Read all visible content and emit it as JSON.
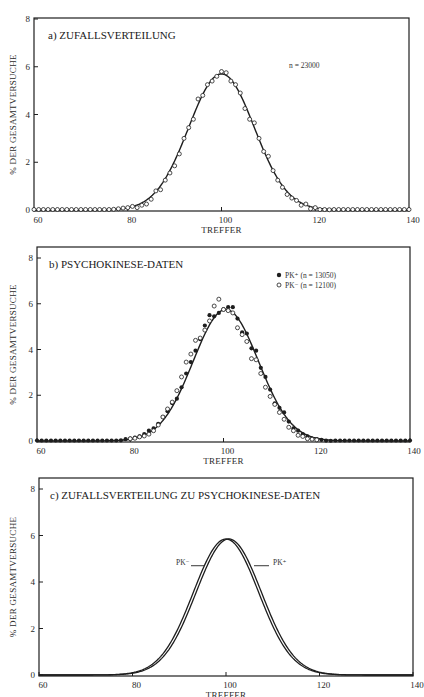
{
  "chart_data": [
    {
      "panel": "a",
      "type": "scatter",
      "title": "a) ZUFALLSVERTEILUNG",
      "xlabel": "TREFFER",
      "ylabel": "% DER GESAMTVERSUCHE",
      "xlim": [
        60,
        140
      ],
      "ylim": [
        0,
        8
      ],
      "xticks": [
        60,
        80,
        100,
        120,
        140
      ],
      "yticks": [
        0,
        2,
        4,
        6,
        8
      ],
      "grid": false,
      "annotation": "n = 23000",
      "fit_curve": {
        "type": "gaussian",
        "mean": 100,
        "peak": 5.7,
        "sd": 7.0
      },
      "series": [
        {
          "name": "Zufall",
          "marker": "open-circle",
          "x": [
            60,
            61,
            62,
            63,
            64,
            65,
            66,
            67,
            68,
            69,
            70,
            71,
            72,
            73,
            74,
            75,
            76,
            77,
            78,
            79,
            80,
            81,
            82,
            83,
            84,
            85,
            86,
            87,
            88,
            89,
            90,
            91,
            92,
            93,
            94,
            95,
            96,
            97,
            98,
            99,
            100,
            101,
            102,
            103,
            104,
            105,
            106,
            107,
            108,
            109,
            110,
            111,
            112,
            113,
            114,
            115,
            116,
            117,
            118,
            119,
            120,
            121,
            122,
            123,
            124,
            125,
            126,
            127,
            128,
            129,
            130,
            131,
            132,
            133,
            134,
            135,
            136,
            137,
            138,
            139,
            140
          ],
          "y": [
            0,
            0,
            0,
            0,
            0,
            0,
            0,
            0,
            0,
            0,
            0,
            0,
            0,
            0,
            0,
            0,
            0.02,
            0.03,
            0.05,
            0.08,
            0.1,
            0.15,
            0.1,
            0.2,
            0.25,
            0.45,
            0.8,
            0.85,
            1.25,
            1.55,
            1.85,
            2.35,
            3.0,
            3.45,
            3.8,
            4.65,
            4.8,
            5.25,
            5.4,
            5.6,
            5.8,
            5.75,
            5.4,
            5.25,
            4.9,
            4.25,
            3.8,
            3.65,
            3.0,
            2.45,
            2.25,
            1.65,
            1.25,
            0.95,
            0.65,
            0.5,
            0.4,
            0.2,
            0.25,
            0.05,
            0.1,
            0.02,
            0.02,
            0.01,
            0,
            0,
            0,
            0,
            0,
            0,
            0,
            0,
            0,
            0,
            0,
            0,
            0,
            0,
            0,
            0,
            0
          ]
        }
      ]
    },
    {
      "panel": "b",
      "type": "scatter",
      "title": "b) PSYCHOKINESE-DATEN",
      "xlabel": "TREFFER",
      "ylabel": "% DER GESAMTVERSUCHE",
      "xlim": [
        60,
        140
      ],
      "ylim": [
        0,
        8
      ],
      "xticks": [
        60,
        80,
        100,
        120,
        140
      ],
      "yticks": [
        0,
        2,
        4,
        6,
        8
      ],
      "grid": false,
      "legend_position": "upper right",
      "fit_curve": {
        "type": "gaussian",
        "mean": 100.5,
        "peak": 5.75,
        "sd": 7.0
      },
      "series": [
        {
          "name": "PK⁺ (n = 13050)",
          "marker": "filled-circle",
          "x": [
            60,
            61,
            62,
            63,
            64,
            65,
            66,
            67,
            68,
            69,
            70,
            71,
            72,
            73,
            74,
            75,
            76,
            77,
            78,
            79,
            80,
            81,
            82,
            83,
            84,
            85,
            86,
            87,
            88,
            89,
            90,
            91,
            92,
            93,
            94,
            95,
            96,
            97,
            98,
            99,
            100,
            101,
            102,
            103,
            104,
            105,
            106,
            107,
            108,
            109,
            110,
            111,
            112,
            113,
            114,
            115,
            116,
            117,
            118,
            119,
            120,
            121,
            122,
            123,
            124,
            125,
            126,
            127,
            128,
            129,
            130,
            131,
            132,
            133,
            134,
            135,
            136,
            137,
            138,
            139,
            140
          ],
          "y": [
            0,
            0,
            0,
            0,
            0,
            0,
            0,
            0,
            0,
            0,
            0,
            0,
            0,
            0,
            0,
            0,
            0,
            0,
            0.03,
            0.08,
            0.1,
            0.15,
            0.2,
            0.3,
            0.45,
            0.55,
            0.75,
            1.05,
            1.3,
            1.65,
            1.85,
            2.35,
            2.95,
            3.45,
            3.95,
            4.45,
            5.05,
            5.5,
            5.45,
            5.6,
            5.75,
            5.85,
            5.85,
            5.35,
            4.75,
            4.7,
            4.05,
            3.95,
            3.2,
            2.8,
            2.25,
            1.65,
            1.45,
            1.25,
            0.85,
            0.55,
            0.45,
            0.3,
            0.2,
            0.1,
            0.08,
            0.05,
            0.02,
            0.01,
            0,
            0,
            0,
            0,
            0,
            0,
            0,
            0,
            0,
            0,
            0,
            0,
            0,
            0,
            0,
            0,
            0
          ]
        },
        {
          "name": "PK⁻ (n = 12100)",
          "marker": "open-circle",
          "x": [
            80,
            81,
            82,
            83,
            84,
            85,
            86,
            87,
            88,
            89,
            90,
            91,
            92,
            93,
            94,
            95,
            96,
            97,
            98,
            99,
            100,
            101,
            102,
            103,
            104,
            105,
            106,
            107,
            108,
            109,
            110,
            111,
            112,
            113,
            114,
            115,
            116,
            117,
            118,
            119,
            120
          ],
          "y": [
            0.1,
            0.12,
            0.18,
            0.22,
            0.3,
            0.45,
            0.7,
            1.05,
            1.4,
            1.7,
            2.2,
            2.8,
            3.45,
            3.8,
            4.4,
            4.5,
            4.85,
            5.25,
            5.9,
            6.2,
            5.75,
            5.7,
            5.6,
            4.95,
            4.65,
            4.35,
            3.6,
            3.55,
            2.95,
            2.35,
            1.95,
            1.6,
            1.25,
            0.95,
            0.6,
            0.45,
            0.25,
            0.2,
            0.1,
            0.08,
            0.05
          ]
        }
      ]
    },
    {
      "panel": "c",
      "type": "line",
      "title": "c) ZUFALLSVERTEILUNG ZU PSYCHOKINESE-DATEN",
      "xlabel": "TREFFER",
      "ylabel": "% DER GESAMTVERSUCHE",
      "xlim": [
        60,
        140
      ],
      "ylim": [
        0,
        8
      ],
      "xticks": [
        60,
        80,
        100,
        120,
        140
      ],
      "yticks": [
        0,
        2,
        4,
        6,
        8
      ],
      "grid": false,
      "series": [
        {
          "name": "PK⁻",
          "type": "gaussian",
          "mean": 100.0,
          "peak": 5.85,
          "sd": 7.0
        },
        {
          "name": "PK⁺",
          "type": "gaussian",
          "mean": 100.6,
          "peak": 5.85,
          "sd": 7.0
        }
      ],
      "annotations": [
        {
          "text": "PK⁻",
          "side": "left",
          "y": 4.7
        },
        {
          "text": "PK⁺",
          "side": "right",
          "y": 4.7
        }
      ]
    }
  ],
  "panels": {
    "a": {
      "title": "a) ZUFALLSVERTEILUNG",
      "annotation": "n = 23000"
    },
    "b": {
      "title": "b) PSYCHOKINESE-DATEN",
      "legend_pk_plus": "PK⁺ (n = 13050)",
      "legend_pk_minus": "PK⁻ (n = 12100)"
    },
    "c": {
      "title": "c) ZUFALLSVERTEILUNG ZU PSYCHOKINESE-DATEN",
      "label_left": "PK⁻",
      "label_right": "PK⁺"
    }
  },
  "axes": {
    "xlabel": "TREFFER",
    "ylabel": "% DER GESAMTVERSUCHE",
    "xticks": [
      "60",
      "80",
      "100",
      "120",
      "140"
    ],
    "yticks": [
      "0",
      "2",
      "4",
      "6",
      "8"
    ]
  },
  "layout": {
    "a": {
      "left": 34,
      "right": 409,
      "top": 18,
      "bottom": 211,
      "y0": 210,
      "y8": 19
    },
    "b": {
      "left": 37,
      "right": 410,
      "top": 247,
      "bottom": 442,
      "y0": 441,
      "y8": 258
    },
    "c": {
      "left": 39,
      "right": 413,
      "top": 478,
      "bottom": 676,
      "y0": 675,
      "y8": 489
    }
  },
  "colors": {
    "ink": "#1e1e1e",
    "paper": "#ffffff"
  }
}
